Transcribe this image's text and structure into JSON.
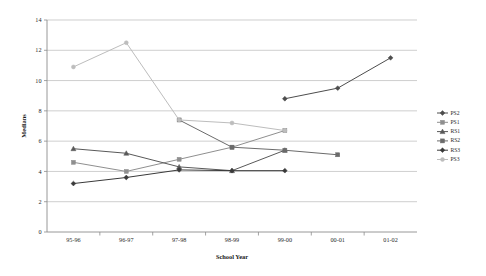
{
  "chart_data": {
    "type": "line",
    "title": "",
    "xlabel": "School Year",
    "ylabel": "Medians",
    "categories": [
      "95-96",
      "96-97",
      "97-98",
      "98-99",
      "99-00",
      "00-01",
      "01-02"
    ],
    "ylim": [
      0,
      14
    ],
    "ytick_step": 2,
    "yticks": [
      "0",
      "2",
      "4",
      "6",
      "8",
      "10",
      "12",
      "14"
    ],
    "grid": "horizontal",
    "legend_position": "right",
    "series": [
      {
        "name": "PS2",
        "color": "#4d4d4d",
        "marker": "diamond",
        "x": [
          "99-00",
          "00-01",
          "01-02"
        ],
        "values": [
          8.8,
          9.5,
          11.5
        ]
      },
      {
        "name": "PS1",
        "color": "#8f8f8f",
        "marker": "square",
        "x": [
          "95-96",
          "96-97",
          "97-98",
          "98-99",
          "99-00"
        ],
        "values": [
          4.6,
          4.0,
          4.8,
          5.6,
          6.7
        ]
      },
      {
        "name": "RS1",
        "color": "#595959",
        "marker": "triangle",
        "x": [
          "95-96",
          "96-97",
          "97-98",
          "98-99",
          "99-00"
        ],
        "values": [
          5.5,
          5.2,
          4.3,
          4.05,
          5.4
        ]
      },
      {
        "name": "RS2",
        "color": "#6b6b6b",
        "marker": "square",
        "x": [
          "97-98",
          "98-99",
          "99-00",
          "00-01"
        ],
        "values": [
          7.4,
          5.6,
          5.4,
          5.1
        ]
      },
      {
        "name": "RS3",
        "color": "#3a3a3a",
        "marker": "diamond",
        "x": [
          "95-96",
          "96-97",
          "97-98",
          "98-99",
          "99-00"
        ],
        "values": [
          3.2,
          3.6,
          4.1,
          4.05,
          4.05
        ]
      },
      {
        "name": "PS3",
        "color": "#bdbdbd",
        "marker": "circle",
        "x": [
          "95-96",
          "96-97",
          "97-98",
          "98-99",
          "99-00"
        ],
        "values": [
          10.9,
          12.5,
          7.4,
          7.2,
          6.7
        ]
      }
    ],
    "legend_order": [
      "PS2",
      "PS1",
      "RS1",
      "RS2",
      "RS3",
      "PS3"
    ]
  }
}
